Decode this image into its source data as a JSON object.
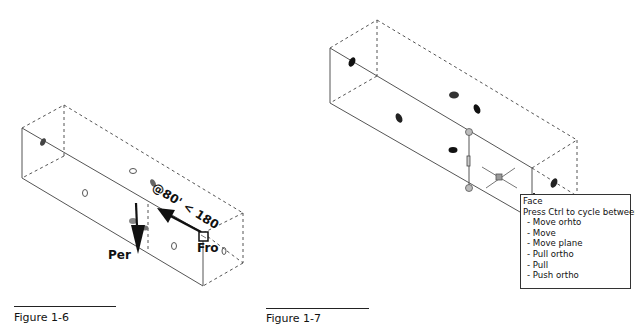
{
  "figures": [
    {
      "id": "fig-1-6",
      "caption": "Figure 1-6",
      "labels": {
        "perpendicular": "Per",
        "from": "Fro",
        "dimension": "@80' < 180"
      }
    },
    {
      "id": "fig-1-7",
      "caption": "Figure 1-7",
      "tooltip": {
        "title": "Face",
        "instruction": "Press Ctrl to cycle between:",
        "options": [
          "- Move orhto",
          "- Move",
          "- Move plane",
          "- Pull ortho",
          "- Pull",
          "- Push ortho"
        ]
      }
    }
  ],
  "colors": {
    "line": "#444444",
    "dashed": "#555555",
    "hole_dark": "#222222",
    "hole_gray": "#555555",
    "grip": "#b8b8b8"
  }
}
